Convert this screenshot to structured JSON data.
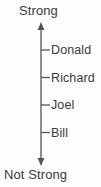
{
  "figure": {
    "type": "vertical-rating-scale",
    "background_color": "#fdfdfd",
    "line_color": "#555555",
    "text_color": "#3a3a3a",
    "top_label": "Strong",
    "bottom_label": "Not Strong",
    "axis": {
      "orientation": "vertical",
      "arrowheads": "both",
      "top_y": 24,
      "bottom_y": 164,
      "x": 41
    },
    "items": [
      {
        "label": "Donald",
        "position": "1",
        "y": 50
      },
      {
        "label": "Richard",
        "position": "2",
        "y": 78
      },
      {
        "label": "Joel",
        "position": "3",
        "y": 105
      },
      {
        "label": "Bill",
        "position": "4",
        "y": 133
      }
    ]
  }
}
